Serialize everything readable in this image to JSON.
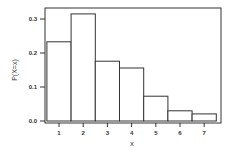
{
  "chart_data": {
    "type": "bar",
    "title": "",
    "xlabel": "x",
    "ylabel": "P(X=x)",
    "categories": [
      "1",
      "2",
      "3",
      "4",
      "5",
      "6",
      "7"
    ],
    "values": [
      0.233,
      0.315,
      0.176,
      0.156,
      0.073,
      0.03,
      0.021
    ],
    "yticks": [
      "0.0",
      "0.1",
      "0.2",
      "0.3"
    ],
    "ytick_values": [
      0.0,
      0.1,
      0.2,
      0.3
    ],
    "ylim": [
      0,
      0.34
    ],
    "grid": false,
    "legend": null,
    "bar_fill": "#ffffff",
    "bar_stroke": "#333333"
  }
}
